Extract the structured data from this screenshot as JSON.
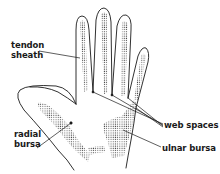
{
  "diagram": {
    "labels": {
      "tendon_sheath": {
        "line1": "tendon",
        "line2": "sheath"
      },
      "radial_bursa": {
        "line1": "radial",
        "line2": "bursa"
      },
      "web_spaces": "web spaces",
      "ulnar_bursa": "ulnar bursa"
    },
    "colors": {
      "outline": "#1a1a1a",
      "stipple": "#333333",
      "background": "#ffffff"
    }
  }
}
